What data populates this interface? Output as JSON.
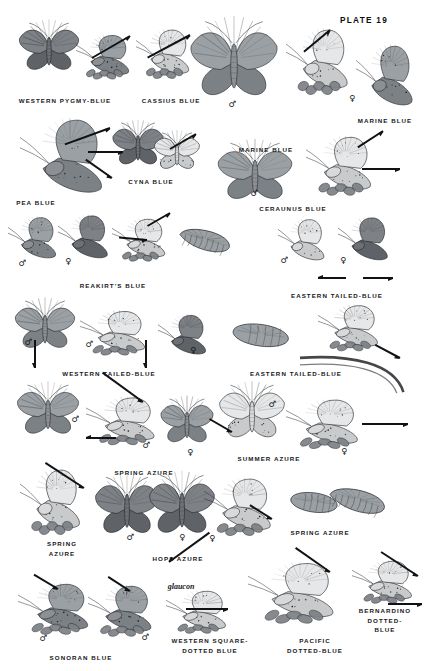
{
  "plate": {
    "number_label": "PLATE 19",
    "page_background": "#ffffff",
    "ink_color": "#16181a",
    "subject": "Blues (Lycaenidae) — field guide plate"
  },
  "symbols": {
    "male": "♂",
    "female": "♀"
  },
  "captions": [
    {
      "id": "western-pygmy-blue",
      "text": "WESTERN PYGMY-BLUE",
      "x": 65,
      "y": 96,
      "lines": 1
    },
    {
      "id": "cassius-blue",
      "text": "CASSIUS BLUE",
      "x": 171,
      "y": 96,
      "lines": 1
    },
    {
      "id": "marine-blue-top",
      "text": "MARINE BLUE",
      "x": 385,
      "y": 116,
      "lines": 1
    },
    {
      "id": "marine-blue-mid",
      "text": "MARINE BLUE",
      "x": 266,
      "y": 145,
      "lines": 1
    },
    {
      "id": "cyna-blue",
      "text": "CYNA BLUE",
      "x": 151,
      "y": 177,
      "lines": 1
    },
    {
      "id": "pea-blue",
      "text": "PEA BLUE",
      "x": 36,
      "y": 198,
      "lines": 1
    },
    {
      "id": "ceraunus-blue",
      "text": "CERAUNUS BLUE",
      "x": 293,
      "y": 204,
      "lines": 1
    },
    {
      "id": "reakirts-blue",
      "text": "REAKIRT'S BLUE",
      "x": 113,
      "y": 281,
      "lines": 1
    },
    {
      "id": "eastern-tailed-blue-upper",
      "text": "EASTERN TAILED-BLUE",
      "x": 337,
      "y": 291,
      "lines": 1
    },
    {
      "id": "western-tailed-blue",
      "text": "WESTERN TAILED-BLUE",
      "x": 109,
      "y": 369,
      "lines": 1
    },
    {
      "id": "eastern-tailed-blue-lower",
      "text": "EASTERN TAILED-BLUE",
      "x": 296,
      "y": 369,
      "lines": 1
    },
    {
      "id": "summer-azure",
      "text": "SUMMER AZURE",
      "x": 269,
      "y": 454,
      "lines": 1
    },
    {
      "id": "spring-azure-mid",
      "text": "SPRING AZURE",
      "x": 144,
      "y": 468,
      "lines": 1
    },
    {
      "id": "spring-azure-right",
      "text": "SPRING AZURE",
      "x": 320,
      "y": 528,
      "lines": 1
    },
    {
      "id": "spring-azure-left",
      "text": "SPRING\nAZURE",
      "x": 62,
      "y": 539,
      "lines": 2
    },
    {
      "id": "hops-azure",
      "text": "HOPS AZURE",
      "x": 178,
      "y": 554,
      "lines": 1
    },
    {
      "id": "bernardino-dotted-blue",
      "text": "BERNARDINO\nDOTTED-BLUE",
      "x": 385,
      "y": 606,
      "lines": 2
    },
    {
      "id": "western-square-dotted-blue",
      "text": "WESTERN SQUARE-\nDOTTED BLUE",
      "x": 210,
      "y": 636,
      "lines": 2
    },
    {
      "id": "pacific-dotted-blue",
      "text": "PACIFIC\nDOTTED-BLUE",
      "x": 315,
      "y": 636,
      "lines": 2
    },
    {
      "id": "sonoran-blue",
      "text": "SONORAN BLUE",
      "x": 81,
      "y": 653,
      "lines": 1
    }
  ],
  "scientific_names": [
    {
      "id": "glaucon",
      "text": "glaucon",
      "x": 181,
      "y": 582
    }
  ],
  "sex_marks": [
    {
      "id": "sex-cassius-male",
      "sex": "male",
      "x": 232,
      "y": 104
    },
    {
      "id": "sex-marine-female",
      "sex": "female",
      "x": 352,
      "y": 98
    },
    {
      "id": "sex-ceraunus-male",
      "sex": "male",
      "x": 254,
      "y": 193
    },
    {
      "id": "sex-reakirt-male",
      "sex": "male",
      "x": 22,
      "y": 263
    },
    {
      "id": "sex-reakirt-female",
      "sex": "female",
      "x": 68,
      "y": 261
    },
    {
      "id": "sex-etb-male",
      "sex": "male",
      "x": 284,
      "y": 260
    },
    {
      "id": "sex-etb-female",
      "sex": "female",
      "x": 343,
      "y": 260
    },
    {
      "id": "sex-wtb-male-1",
      "sex": "male",
      "x": 28,
      "y": 342
    },
    {
      "id": "sex-wtb-male-2",
      "sex": "male",
      "x": 89,
      "y": 344
    },
    {
      "id": "sex-wtb-female",
      "sex": "female",
      "x": 193,
      "y": 350
    },
    {
      "id": "sex-spring-male",
      "sex": "male",
      "x": 75,
      "y": 419
    },
    {
      "id": "sex-spring-male-2",
      "sex": "male",
      "x": 146,
      "y": 445
    },
    {
      "id": "sex-spring-female",
      "sex": "female",
      "x": 190,
      "y": 452
    },
    {
      "id": "sex-summer-female",
      "sex": "female",
      "x": 344,
      "y": 451
    },
    {
      "id": "sex-summer-male",
      "sex": "male",
      "x": 272,
      "y": 404
    },
    {
      "id": "sex-hops-male",
      "sex": "male",
      "x": 130,
      "y": 537
    },
    {
      "id": "sex-hops-female",
      "sex": "female",
      "x": 182,
      "y": 537
    },
    {
      "id": "sex-spring-r-female",
      "sex": "female",
      "x": 212,
      "y": 538
    },
    {
      "id": "sex-sonoran-male-1",
      "sex": "male",
      "x": 43,
      "y": 638
    },
    {
      "id": "sex-sonoran-male-2",
      "sex": "male",
      "x": 145,
      "y": 637
    }
  ],
  "pointers": [
    {
      "id": "ptr-pygmy",
      "x": 130,
      "y": 36,
      "len": 44,
      "angle": 150
    },
    {
      "id": "ptr-cassius",
      "x": 190,
      "y": 35,
      "len": 48,
      "angle": 152
    },
    {
      "id": "ptr-marine-top",
      "x": 330,
      "y": 30,
      "len": 34,
      "angle": 140
    },
    {
      "id": "ptr-pea-1",
      "x": 110,
      "y": 128,
      "len": 48,
      "angle": 160
    },
    {
      "id": "ptr-pea-2",
      "x": 123,
      "y": 152,
      "len": 35,
      "angle": 180
    },
    {
      "id": "ptr-pea-3",
      "x": 112,
      "y": 178,
      "len": 32,
      "angle": 215
    },
    {
      "id": "ptr-cyna",
      "x": 196,
      "y": 134,
      "len": 30,
      "angle": 150
    },
    {
      "id": "ptr-ceraunus-1",
      "x": 383,
      "y": 131,
      "len": 30,
      "angle": 147
    },
    {
      "id": "ptr-ceraunus-2",
      "x": 400,
      "y": 169,
      "len": 38,
      "angle": 180
    },
    {
      "id": "ptr-reakirt",
      "x": 170,
      "y": 213,
      "len": 26,
      "angle": 150
    },
    {
      "id": "ptr-reakirt-2",
      "x": 147,
      "y": 240,
      "len": 28,
      "angle": 185
    },
    {
      "id": "ptr-etb-left",
      "x": 318,
      "y": 278,
      "len": 28,
      "angle": 0
    },
    {
      "id": "ptr-etb-right",
      "x": 393,
      "y": 278,
      "len": 30,
      "angle": 180
    },
    {
      "id": "ptr-wtb-1",
      "x": 35,
      "y": 368,
      "len": 28,
      "angle": 270
    },
    {
      "id": "ptr-wtb-2",
      "x": 146,
      "y": 368,
      "len": 28,
      "angle": 270
    },
    {
      "id": "ptr-etb-lower",
      "x": 400,
      "y": 358,
      "len": 28,
      "angle": 208
    },
    {
      "id": "ptr-spring-1",
      "x": 143,
      "y": 402,
      "len": 50,
      "angle": 216
    },
    {
      "id": "ptr-spring-2",
      "x": 86,
      "y": 438,
      "len": 30,
      "angle": 0
    },
    {
      "id": "ptr-summer",
      "x": 408,
      "y": 424,
      "len": 46,
      "angle": 180
    },
    {
      "id": "ptr-summer-2",
      "x": 232,
      "y": 432,
      "len": 26,
      "angle": 210
    },
    {
      "id": "ptr-spring-left",
      "x": 84,
      "y": 488,
      "len": 46,
      "angle": 213
    },
    {
      "id": "ptr-hops",
      "x": 169,
      "y": 562,
      "len": 50,
      "angle": 324
    },
    {
      "id": "ptr-spring-right",
      "x": 272,
      "y": 519,
      "len": 26,
      "angle": 212
    },
    {
      "id": "ptr-sonoran-1",
      "x": 58,
      "y": 589,
      "len": 28,
      "angle": 211
    },
    {
      "id": "ptr-sonoran-2",
      "x": 130,
      "y": 591,
      "len": 26,
      "angle": 213
    },
    {
      "id": "ptr-wsdb",
      "x": 228,
      "y": 609,
      "len": 42,
      "angle": 180
    },
    {
      "id": "ptr-pacific",
      "x": 330,
      "y": 572,
      "len": 42,
      "angle": 215
    },
    {
      "id": "ptr-bern-1",
      "x": 418,
      "y": 576,
      "len": 44,
      "angle": 213
    },
    {
      "id": "ptr-bern-2",
      "x": 422,
      "y": 604,
      "len": 34,
      "angle": 180
    }
  ],
  "figures": [
    {
      "id": "fig-pygmy-dorsal",
      "species": "western-pygmy-blue",
      "view": "dorsal-spread",
      "x": 16,
      "y": 22,
      "w": 66,
      "h": 52,
      "rot": 0,
      "tone": "dark"
    },
    {
      "id": "fig-pygmy-ventral",
      "species": "western-pygmy-blue",
      "view": "ventral-perched",
      "x": 76,
      "y": 30,
      "w": 62,
      "h": 54,
      "rot": 0,
      "tone": "mid"
    },
    {
      "id": "fig-cassius-ventral",
      "species": "cassius-blue",
      "view": "ventral-perched",
      "x": 136,
      "y": 24,
      "w": 62,
      "h": 60,
      "rot": 0,
      "tone": "light"
    },
    {
      "id": "fig-cassius-dorsal",
      "species": "cassius-blue",
      "view": "dorsal-spread",
      "x": 186,
      "y": 20,
      "w": 96,
      "h": 82,
      "rot": 0,
      "tone": "mid"
    },
    {
      "id": "fig-marine-ventral",
      "species": "marine-blue",
      "view": "ventral-perched",
      "x": 286,
      "y": 22,
      "w": 72,
      "h": 80,
      "rot": 0,
      "tone": "light"
    },
    {
      "id": "fig-marine-dorsal",
      "species": "marine-blue",
      "view": "ventral-side",
      "x": 356,
      "y": 38,
      "w": 66,
      "h": 70,
      "rot": 0,
      "tone": "mid"
    },
    {
      "id": "fig-pea-ventral",
      "species": "pea-blue",
      "view": "ventral-side",
      "x": 20,
      "y": 110,
      "w": 96,
      "h": 86,
      "rot": 0,
      "tone": "mid"
    },
    {
      "id": "fig-cyna-dorsal",
      "species": "cyna-blue",
      "view": "dorsal-spread",
      "x": 110,
      "y": 122,
      "w": 56,
      "h": 46,
      "rot": 0,
      "tone": "dark"
    },
    {
      "id": "fig-cyna-ventral",
      "species": "cyna-blue",
      "view": "ventral-spread",
      "x": 152,
      "y": 132,
      "w": 50,
      "h": 40,
      "rot": 0,
      "tone": "light"
    },
    {
      "id": "fig-ceraunus-dorsal",
      "species": "ceraunus-blue",
      "view": "dorsal-spread",
      "x": 214,
      "y": 142,
      "w": 82,
      "h": 62,
      "rot": 0,
      "tone": "mid"
    },
    {
      "id": "fig-ceraunus-ventral",
      "species": "ceraunus-blue",
      "view": "ventral-perched",
      "x": 306,
      "y": 130,
      "w": 76,
      "h": 72,
      "rot": 0,
      "tone": "light"
    },
    {
      "id": "fig-reakirt-male",
      "species": "reakirts-blue",
      "view": "ventral-side",
      "x": 8,
      "y": 212,
      "w": 56,
      "h": 48,
      "rot": 0,
      "tone": "mid"
    },
    {
      "id": "fig-reakirt-female",
      "species": "reakirts-blue",
      "view": "ventral-side",
      "x": 58,
      "y": 210,
      "w": 58,
      "h": 50,
      "rot": 0,
      "tone": "dark"
    },
    {
      "id": "fig-reakirt-ventral",
      "species": "reakirts-blue",
      "view": "ventral-perched",
      "x": 112,
      "y": 214,
      "w": 62,
      "h": 52,
      "rot": 0,
      "tone": "light"
    },
    {
      "id": "fig-reakirt-larva",
      "species": "reakirts-blue",
      "view": "larva",
      "x": 180,
      "y": 214,
      "w": 60,
      "h": 44,
      "rot": 0,
      "tone": "mid"
    },
    {
      "id": "fig-etb-male",
      "species": "eastern-tailed-blue",
      "view": "ventral-side",
      "x": 278,
      "y": 214,
      "w": 54,
      "h": 48,
      "rot": 0,
      "tone": "light"
    },
    {
      "id": "fig-etb-female",
      "species": "eastern-tailed-blue",
      "view": "ventral-side",
      "x": 338,
      "y": 212,
      "w": 58,
      "h": 50,
      "rot": 0,
      "tone": "dark"
    },
    {
      "id": "fig-wtb-male",
      "species": "western-tailed-blue",
      "view": "dorsal-spread",
      "x": 12,
      "y": 300,
      "w": 66,
      "h": 52,
      "rot": 0,
      "tone": "mid"
    },
    {
      "id": "fig-wtb-ventral",
      "species": "western-tailed-blue",
      "view": "ventral-perched",
      "x": 80,
      "y": 306,
      "w": 76,
      "h": 54,
      "rot": 0,
      "tone": "light"
    },
    {
      "id": "fig-wtb-female",
      "species": "western-tailed-blue",
      "view": "ventral-side",
      "x": 158,
      "y": 310,
      "w": 56,
      "h": 46,
      "rot": 0,
      "tone": "dark"
    },
    {
      "id": "fig-etb-pupa",
      "species": "eastern-tailed-blue",
      "view": "pupa",
      "x": 232,
      "y": 312,
      "w": 62,
      "h": 36,
      "rot": 0,
      "tone": "mid"
    },
    {
      "id": "fig-etb-ventral",
      "species": "eastern-tailed-blue",
      "view": "ventral-perched",
      "x": 318,
      "y": 300,
      "w": 70,
      "h": 56,
      "rot": 0,
      "tone": "light"
    },
    {
      "id": "fig-etb-stem",
      "species": "eastern-tailed-blue",
      "view": "stem",
      "x": 300,
      "y": 350,
      "w": 110,
      "h": 44,
      "rot": 0,
      "tone": "dark"
    },
    {
      "id": "fig-spring-male",
      "species": "spring-azure",
      "view": "dorsal-spread",
      "x": 14,
      "y": 384,
      "w": 68,
      "h": 54,
      "rot": 0,
      "tone": "mid"
    },
    {
      "id": "fig-spring-ventral",
      "species": "spring-azure",
      "view": "ventral-perched",
      "x": 86,
      "y": 392,
      "w": 80,
      "h": 58,
      "rot": 0,
      "tone": "light"
    },
    {
      "id": "fig-spring-female",
      "species": "spring-azure",
      "view": "dorsal-spread",
      "x": 158,
      "y": 398,
      "w": 58,
      "h": 48,
      "rot": 0,
      "tone": "mid"
    },
    {
      "id": "fig-summer-male",
      "species": "summer-azure",
      "view": "dorsal-spread",
      "x": 216,
      "y": 384,
      "w": 72,
      "h": 58,
      "rot": 0,
      "tone": "light"
    },
    {
      "id": "fig-summer-ventral",
      "species": "summer-azure",
      "view": "ventral-perched",
      "x": 286,
      "y": 394,
      "w": 84,
      "h": 60,
      "rot": 0,
      "tone": "light"
    },
    {
      "id": "fig-spring-l-ventral",
      "species": "spring-azure",
      "view": "ventral-perched",
      "x": 20,
      "y": 462,
      "w": 70,
      "h": 80,
      "rot": 0,
      "tone": "light"
    },
    {
      "id": "fig-hops-male",
      "species": "hops-azure",
      "view": "dorsal-spread",
      "x": 92,
      "y": 476,
      "w": 70,
      "h": 62,
      "rot": 0,
      "tone": "dark"
    },
    {
      "id": "fig-hops-female",
      "species": "hops-azure",
      "view": "dorsal-spread",
      "x": 146,
      "y": 474,
      "w": 72,
      "h": 64,
      "rot": 0,
      "tone": "dark"
    },
    {
      "id": "fig-spring-r-ventral",
      "species": "spring-azure",
      "view": "ventral-perched",
      "x": 204,
      "y": 472,
      "w": 78,
      "h": 70,
      "rot": 0,
      "tone": "light"
    },
    {
      "id": "fig-spring-pupa",
      "species": "spring-azure",
      "view": "pupa",
      "x": 290,
      "y": 482,
      "w": 52,
      "h": 32,
      "rot": 0,
      "tone": "mid"
    },
    {
      "id": "fig-spring-larva",
      "species": "spring-azure",
      "view": "larva",
      "x": 330,
      "y": 472,
      "w": 66,
      "h": 48,
      "rot": 0,
      "tone": "mid"
    },
    {
      "id": "fig-sonoran-1",
      "species": "sonoran-blue",
      "view": "ventral-perched",
      "x": 18,
      "y": 578,
      "w": 82,
      "h": 62,
      "rot": 0,
      "tone": "mid"
    },
    {
      "id": "fig-sonoran-2",
      "species": "sonoran-blue",
      "view": "ventral-perched",
      "x": 88,
      "y": 580,
      "w": 74,
      "h": 62,
      "rot": 0,
      "tone": "mid"
    },
    {
      "id": "fig-wsdb",
      "species": "western-square-dotted-blue",
      "view": "ventral-perched",
      "x": 166,
      "y": 586,
      "w": 70,
      "h": 52,
      "rot": 0,
      "tone": "light"
    },
    {
      "id": "fig-pacific",
      "species": "pacific-dotted-blue",
      "view": "ventral-perched",
      "x": 248,
      "y": 556,
      "w": 100,
      "h": 74,
      "rot": 0,
      "tone": "light"
    },
    {
      "id": "fig-bernardino",
      "species": "bernardino-dotted-blue",
      "view": "ventral-perched",
      "x": 352,
      "y": 556,
      "w": 70,
      "h": 52,
      "rot": 0,
      "tone": "light"
    }
  ]
}
